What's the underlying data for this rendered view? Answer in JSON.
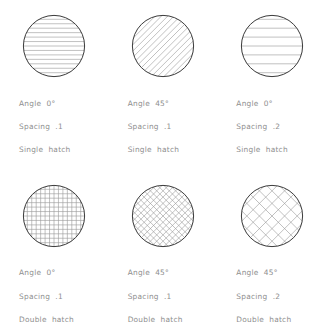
{
  "page": {
    "background_color": "#ffffff",
    "outline_color": "#3a3a3a",
    "hatch_color": "#9a9a9a",
    "text_color": "#8e8e8e"
  },
  "samples": [
    {
      "id": "sample-1",
      "angle_label": "Angle  0°",
      "spacing_label": "Spacing  .1",
      "type_label": "Single  hatch",
      "angle_deg": 0,
      "spacing": 0.1,
      "hatch_type": "single"
    },
    {
      "id": "sample-2",
      "angle_label": "Angle  45°",
      "spacing_label": "Spacing  .1",
      "type_label": "Single  hatch",
      "angle_deg": 45,
      "spacing": 0.1,
      "hatch_type": "single"
    },
    {
      "id": "sample-3",
      "angle_label": "Angle  0°",
      "spacing_label": "Spacing  .2",
      "type_label": "Single  hatch",
      "angle_deg": 0,
      "spacing": 0.2,
      "hatch_type": "single"
    },
    {
      "id": "sample-4",
      "angle_label": "Angle  0°",
      "spacing_label": "Spacing  .1",
      "type_label": "Double  hatch",
      "angle_deg": 0,
      "spacing": 0.1,
      "hatch_type": "double"
    },
    {
      "id": "sample-5",
      "angle_label": "Angle  45°",
      "spacing_label": "Spacing  .1",
      "type_label": "Double  hatch",
      "angle_deg": 45,
      "spacing": 0.1,
      "hatch_type": "double"
    },
    {
      "id": "sample-6",
      "angle_label": "Angle  45°",
      "spacing_label": "Spacing  .2",
      "type_label": "Double  hatch",
      "angle_deg": 45,
      "spacing": 0.2,
      "hatch_type": "double"
    }
  ],
  "geometry": {
    "circle_radius": 31,
    "circle_center_x": 33,
    "circle_center_y": 33,
    "spacing_px_fine": 4.45,
    "spacing_px_coarse": 8.9
  }
}
